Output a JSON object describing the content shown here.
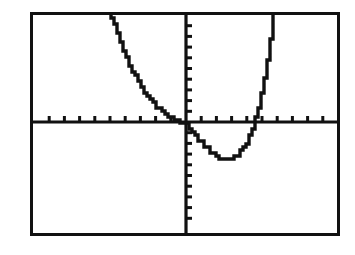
{
  "document": {
    "kind": "graphing-calculator-screen",
    "background_color": "#ffffff",
    "ink_color": "#111111"
  },
  "screen": {
    "frame_label": "calculator-graph-frame",
    "border_color": "#111111",
    "border_width_px": 3,
    "left_px": 30,
    "top_px": 12,
    "width_px": 310,
    "height_px": 224
  },
  "chart_data": {
    "type": "line",
    "title": "",
    "subtitle": "",
    "xlabel": "",
    "ylabel": "",
    "legend": [],
    "legend_position": "none",
    "grid": false,
    "axes": {
      "x_axis_visible": true,
      "y_axis_visible": true,
      "x_axis_pixel_y": 122,
      "y_axis_pixel_x": 186,
      "xlim": [
        -10,
        10
      ],
      "ylim": [
        -10,
        10
      ],
      "x_tick_step": 1,
      "y_tick_step": 1,
      "x_tick_values": [
        -9,
        -8,
        -7,
        -6,
        -5,
        -4,
        -3,
        -2,
        -1,
        1,
        2,
        3,
        4,
        5,
        6,
        7,
        8,
        9
      ],
      "y_tick_values": [
        -9,
        -8,
        -7,
        -6,
        -5,
        -4,
        -3,
        -2,
        -1,
        1,
        2,
        3,
        4,
        5,
        6,
        7,
        8,
        9
      ],
      "tick_length_px": 6,
      "tick_labels_shown": false
    },
    "series": [
      {
        "name": "y1",
        "style": "pixelated-dotted",
        "description": "steeply decreasing left branch, shallow crossing near origin, local minimum right of origin, steeply increasing right branch",
        "x": [
          -5.0,
          -4.8,
          -4.6,
          -4.4,
          -4.2,
          -4.0,
          -3.8,
          -3.6,
          -3.4,
          -3.2,
          -3.0,
          -2.8,
          -2.6,
          -2.4,
          -2.2,
          -2.0,
          -1.8,
          -1.6,
          -1.4,
          -1.2,
          -1.0,
          -0.8,
          -0.6,
          -0.4,
          -0.2,
          0.0,
          0.25,
          0.5,
          0.75,
          1.0,
          1.25,
          1.5,
          1.75,
          2.0,
          2.25,
          2.5,
          2.75,
          3.0,
          3.25,
          3.5,
          3.75,
          4.0,
          4.2,
          4.4,
          4.6,
          4.8,
          5.0,
          5.2,
          5.4,
          5.6,
          5.8
        ],
        "y": [
          10.6,
          9.7,
          8.85,
          8.0,
          7.25,
          6.5,
          5.8,
          5.15,
          4.55,
          4.0,
          3.5,
          3.05,
          2.62,
          2.24,
          1.9,
          1.58,
          1.3,
          1.05,
          0.82,
          0.62,
          0.45,
          0.28,
          0.14,
          0.02,
          -0.08,
          -0.2,
          -0.62,
          -1.05,
          -1.48,
          -1.9,
          -2.28,
          -2.62,
          -2.92,
          -3.16,
          -3.34,
          -3.44,
          -3.48,
          -3.42,
          -3.25,
          -2.96,
          -2.52,
          -1.92,
          -1.3,
          -0.55,
          0.35,
          1.42,
          2.68,
          4.14,
          5.82,
          7.72,
          9.86
        ]
      }
    ],
    "key_points": {
      "left_x_intercept": -0.35,
      "right_x_intercept": 4.55,
      "local_minimum": {
        "x": 2.72,
        "y": -3.49
      },
      "y_intercept": -0.2
    }
  }
}
